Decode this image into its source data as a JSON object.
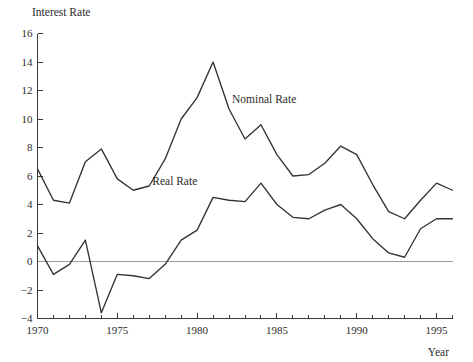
{
  "chart_data": {
    "type": "line",
    "title": "",
    "xlabel": "Year",
    "ylabel": "Interest Rate",
    "xlim": [
      1970,
      1996
    ],
    "ylim": [
      -4,
      16
    ],
    "grid": false,
    "legend_position": "inline-annotation",
    "y_ticks": [
      -4,
      -2,
      0,
      2,
      4,
      6,
      8,
      10,
      12,
      14,
      16
    ],
    "y_tick_labels": [
      "−4",
      "−2",
      "0",
      "2",
      "4",
      "6",
      "8",
      "10",
      "12",
      "14",
      "16"
    ],
    "x_ticks": [
      1970,
      1971,
      1972,
      1973,
      1974,
      1975,
      1976,
      1977,
      1978,
      1979,
      1980,
      1981,
      1982,
      1983,
      1984,
      1985,
      1986,
      1987,
      1988,
      1989,
      1990,
      1991,
      1992,
      1993,
      1994,
      1995,
      1996
    ],
    "x_tick_labels_shown": [
      "1970",
      "1975",
      "1980",
      "1985",
      "1990",
      "1995"
    ],
    "x_labeled_ticks": [
      1970,
      1975,
      1980,
      1985,
      1990,
      1995
    ],
    "zero_reference_line": 0,
    "x": [
      1970,
      1971,
      1972,
      1973,
      1974,
      1975,
      1976,
      1977,
      1978,
      1979,
      1980,
      1981,
      1982,
      1983,
      1984,
      1985,
      1986,
      1987,
      1988,
      1989,
      1990,
      1991,
      1992,
      1993,
      1994,
      1995,
      1996
    ],
    "series": [
      {
        "name": "Nominal Rate",
        "label": "Nominal Rate",
        "label_x": 1984.2,
        "label_y": 11.1,
        "color": "#333333",
        "values": [
          6.5,
          4.3,
          4.1,
          7.0,
          7.9,
          5.8,
          5.0,
          5.3,
          7.2,
          10.0,
          11.5,
          14.0,
          10.7,
          8.6,
          9.6,
          7.5,
          6.0,
          6.1,
          6.9,
          8.1,
          7.5,
          5.4,
          3.5,
          3.0,
          4.3,
          5.5,
          5.0
        ]
      },
      {
        "name": "Real Rate",
        "label": "Real Rate",
        "label_x": 1978.6,
        "label_y": 5.4,
        "color": "#333333",
        "values": [
          1.1,
          -0.9,
          -0.2,
          1.5,
          -3.6,
          -0.9,
          -1.0,
          -1.2,
          -0.2,
          1.5,
          2.2,
          4.5,
          4.3,
          4.2,
          5.5,
          4.0,
          3.1,
          3.0,
          3.6,
          4.0,
          3.0,
          1.6,
          0.6,
          0.3,
          2.3,
          3.0,
          3.0
        ]
      }
    ]
  }
}
